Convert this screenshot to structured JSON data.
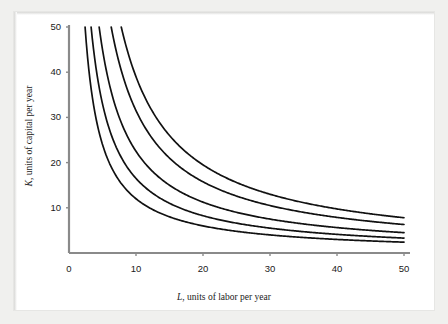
{
  "figure": {
    "background_color": "#ffffff",
    "frame_color": "#f0f0ee",
    "axis_color": "#8a8a8a",
    "curve_color": "#111111"
  },
  "chart_data": {
    "type": "line",
    "title": "",
    "subtitle": "",
    "xlabel": "L, units of labor per year",
    "xlabel_symbol": "L",
    "xlabel_rest": ", units of labor per year",
    "ylabel": "K, units of capital per year",
    "ylabel_symbol": "K",
    "ylabel_rest": ", units of capital per year",
    "xlim": [
      0,
      52
    ],
    "ylim": [
      0,
      52
    ],
    "xticks": [
      0,
      10,
      20,
      30,
      40,
      50
    ],
    "xticklabels": [
      "0",
      "10",
      "20",
      "30",
      "40",
      "50"
    ],
    "yticks": [
      10,
      20,
      30,
      40,
      50
    ],
    "yticklabels": [
      "10",
      "20",
      "30",
      "40",
      "50"
    ],
    "grid": false,
    "legend": "none",
    "curve_family": "isoquants",
    "curve_equation": "K * L = q",
    "series": [
      {
        "name": "isoquant-1",
        "q": 120,
        "points": [
          [
            2.4,
            50.0
          ],
          [
            3.0,
            40.0
          ],
          [
            4.0,
            30.0
          ],
          [
            5.0,
            24.0
          ],
          [
            6.0,
            20.0
          ],
          [
            8.0,
            15.0
          ],
          [
            10.0,
            12.0
          ],
          [
            12.0,
            10.0
          ],
          [
            15.0,
            8.0
          ],
          [
            20.0,
            6.0
          ],
          [
            24.0,
            5.0
          ],
          [
            30.0,
            4.0
          ],
          [
            40.0,
            3.0
          ],
          [
            50.0,
            2.4
          ]
        ]
      },
      {
        "name": "isoquant-2",
        "q": 165,
        "points": [
          [
            3.3,
            50.0
          ],
          [
            4.13,
            40.0
          ],
          [
            5.5,
            30.0
          ],
          [
            6.88,
            24.0
          ],
          [
            8.25,
            20.0
          ],
          [
            11.0,
            15.0
          ],
          [
            13.75,
            12.0
          ],
          [
            16.5,
            10.0
          ],
          [
            20.6,
            8.0
          ],
          [
            27.5,
            6.0
          ],
          [
            33.0,
            5.0
          ],
          [
            41.25,
            4.0
          ],
          [
            50.0,
            3.3
          ]
        ]
      },
      {
        "name": "isoquant-3",
        "q": 225,
        "points": [
          [
            4.5,
            50.0
          ],
          [
            5.63,
            40.0
          ],
          [
            7.5,
            30.0
          ],
          [
            9.38,
            24.0
          ],
          [
            11.25,
            20.0
          ],
          [
            15.0,
            15.0
          ],
          [
            18.75,
            12.0
          ],
          [
            22.5,
            10.0
          ],
          [
            28.1,
            8.0
          ],
          [
            37.5,
            6.0
          ],
          [
            45.0,
            5.0
          ],
          [
            50.0,
            4.5
          ]
        ]
      },
      {
        "name": "isoquant-4",
        "q": 315,
        "points": [
          [
            6.3,
            50.0
          ],
          [
            7.88,
            40.0
          ],
          [
            10.5,
            30.0
          ],
          [
            13.1,
            24.0
          ],
          [
            15.75,
            20.0
          ],
          [
            21.0,
            15.0
          ],
          [
            26.25,
            12.0
          ],
          [
            31.5,
            10.0
          ],
          [
            39.4,
            8.0
          ],
          [
            50.0,
            6.3
          ]
        ]
      },
      {
        "name": "isoquant-5",
        "q": 390,
        "points": [
          [
            7.8,
            50.0
          ],
          [
            9.75,
            40.0
          ],
          [
            13.0,
            30.0
          ],
          [
            16.25,
            24.0
          ],
          [
            19.5,
            20.0
          ],
          [
            26.0,
            15.0
          ],
          [
            32.5,
            12.0
          ],
          [
            39.0,
            10.0
          ],
          [
            48.75,
            8.0
          ],
          [
            50.0,
            7.8
          ]
        ]
      }
    ]
  }
}
